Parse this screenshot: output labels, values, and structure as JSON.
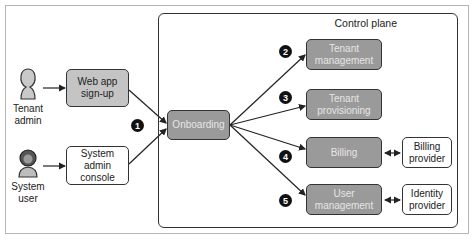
{
  "diagram": {
    "control_plane_label": "Control plane",
    "actors": [
      {
        "id": "tenant-admin",
        "label_line1": "Tenant",
        "label_line2": "admin"
      },
      {
        "id": "system-user",
        "label_line1": "System",
        "label_line2": "user"
      }
    ],
    "entry_boxes": [
      {
        "id": "web-app-signup",
        "line1": "Web app",
        "line2": "sign-up"
      },
      {
        "id": "system-admin-console",
        "line1": "System admin",
        "line2": "console"
      }
    ],
    "onboarding": {
      "label": "Onboarding"
    },
    "services": [
      {
        "id": "tenant-management",
        "line1": "Tenant",
        "line2": "management",
        "badge": "2"
      },
      {
        "id": "tenant-provisioning",
        "line1": "Tenant",
        "line2": "provisioning",
        "badge": "3"
      },
      {
        "id": "billing",
        "line1": "Billing",
        "line2": "",
        "badge": "4"
      },
      {
        "id": "user-management",
        "line1": "User",
        "line2": "management",
        "badge": "5"
      }
    ],
    "external": [
      {
        "id": "billing-provider",
        "line1": "Billing",
        "line2": "provider"
      },
      {
        "id": "identity-provider",
        "line1": "Identity",
        "line2": "provider"
      }
    ],
    "onboarding_badge": "1",
    "colors": {
      "dark_box": "#9a9a9a",
      "light_box": "#c4c4c4",
      "border": "#333333",
      "badge": "#111111"
    }
  }
}
